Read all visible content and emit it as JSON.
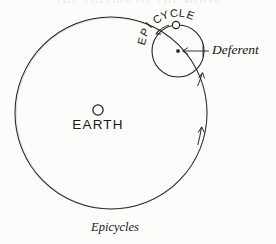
{
  "figure": {
    "title_remnant": "THE THEORY OF THE MOON",
    "caption": "Epicycles",
    "background_color": "#fcfcfb",
    "ink_color": "#1a1a1a"
  },
  "labels": {
    "earth": "EARTH",
    "deferent": "Deferent",
    "epicycle": "EPICYCLE",
    "epicycle_chars": [
      "E",
      "P",
      "I",
      "C",
      "Y",
      "C",
      "L",
      "E"
    ]
  },
  "diagram_data": {
    "type": "astronomical-schematic",
    "model": "Ptolemaic epicycle-on-deferent",
    "elements": [
      {
        "name": "deferent-circle",
        "shape": "circle",
        "center": [
          111,
          113
        ],
        "radius": 96,
        "stroke": "#1a1a1a",
        "stroke_width": 1,
        "fill": "none"
      },
      {
        "name": "epicycle-circle",
        "shape": "circle",
        "center": [
          178,
          51
        ],
        "radius": 26,
        "stroke": "#1a1a1a",
        "stroke_width": 1,
        "fill": "none"
      },
      {
        "name": "earth-marker",
        "shape": "circle-open",
        "center": [
          98,
          110
        ],
        "radius": 5,
        "stroke": "#1a1a1a",
        "fill": "none"
      },
      {
        "name": "epicycle-center-marker",
        "shape": "square-filled",
        "center": [
          178,
          51
        ],
        "size": 3,
        "fill": "#1a1a1a"
      },
      {
        "name": "planet-marker",
        "shape": "circle-open",
        "center": [
          176,
          25
        ],
        "radius": 3.5,
        "stroke": "#1a1a1a",
        "fill": "none"
      }
    ],
    "arrows": [
      {
        "name": "epicycle-rotation-arrow",
        "position": [
          160,
          27
        ],
        "direction": "counterclockwise-along-epicycle",
        "description": "small arrow on upper-left of epicycle indicating planet motion"
      },
      {
        "name": "deferent-rotation-arrow-upper",
        "position": [
          201,
          76
        ],
        "direction": "up-along-deferent",
        "description": "arrow on deferent just below epicycle"
      },
      {
        "name": "deferent-rotation-arrow-lower",
        "position": [
          200,
          132
        ],
        "direction": "up-along-deferent",
        "description": "arrow on right side of deferent"
      },
      {
        "name": "deferent-leader-arrow",
        "position": [
          210,
          51
        ],
        "direction": "left",
        "description": "leader line from Deferent label to epicycle center"
      }
    ],
    "annotations": [
      {
        "text": "EARTH",
        "position": [
          98,
          126
        ],
        "style": "sans-caps"
      },
      {
        "text": "Deferent",
        "position": [
          212,
          50
        ],
        "style": "italic-serif"
      },
      {
        "text": "EPICYCLE",
        "position": [
          152,
          80
        ],
        "style": "sans-caps-curved"
      },
      {
        "text": "Epicycles",
        "position": [
          115,
          227
        ],
        "style": "italic-serif-caption"
      }
    ]
  }
}
